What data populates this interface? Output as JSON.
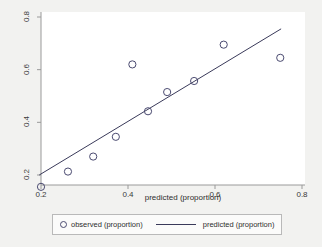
{
  "chart_data": {
    "type": "scatter",
    "title": "",
    "xlabel": "predicted (proportion)",
    "ylabel": "",
    "xlim": [
      0.2,
      0.8
    ],
    "ylim": [
      0.2,
      0.8
    ],
    "xticks": [
      "0.2",
      "0.4",
      "0.6",
      "0.8"
    ],
    "xtick_values": [
      0.2,
      0.4,
      0.6,
      0.8
    ],
    "yticks": [
      "0.2",
      "0.4",
      "0.6",
      "0.8"
    ],
    "ytick_values": [
      0.2,
      0.4,
      0.6,
      0.8
    ],
    "grid": false,
    "legend_position": "bottom",
    "series": [
      {
        "name": "observed (proportion)",
        "type": "scatter",
        "marker": "open-circle",
        "color": "#4a4a70",
        "x": [
          0.2,
          0.262,
          0.32,
          0.372,
          0.41,
          0.446,
          0.49,
          0.552,
          0.62,
          0.75
        ],
        "y": [
          0.155,
          0.213,
          0.27,
          0.345,
          0.62,
          0.442,
          0.515,
          0.557,
          0.695,
          0.645
        ]
      },
      {
        "name": "predicted (proportion)",
        "type": "line",
        "color": "#3a3a5a",
        "x": [
          0.196,
          0.752
        ],
        "y": [
          0.2,
          0.755
        ]
      }
    ]
  },
  "axis": {
    "x_title": "predicted (proportion)",
    "x_tick_labels": [
      "0.2",
      "0.4",
      "0.6",
      "0.8"
    ],
    "y_tick_labels": [
      "0.2",
      "0.4",
      "0.6",
      "0.8"
    ]
  },
  "legend": {
    "observed_label": "observed (proportion)",
    "predicted_label": "predicted (proportion)"
  },
  "colors": {
    "background": "#f2f2f0",
    "plot_background": "#ffffff",
    "axis": "#9a9a9a",
    "marker": "#4a4a70",
    "line": "#3a3a5a",
    "text": "#2e2e2e"
  }
}
